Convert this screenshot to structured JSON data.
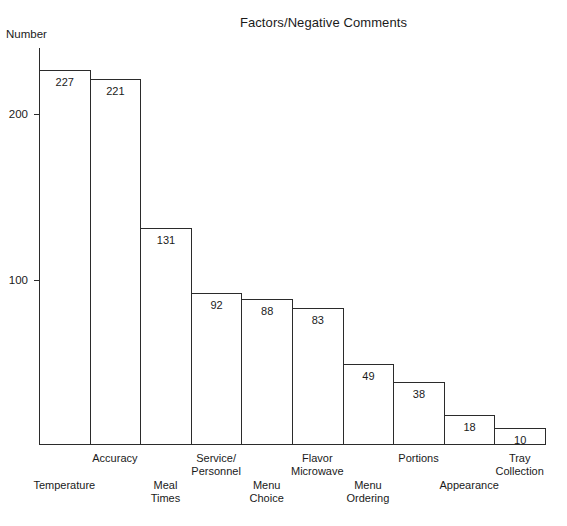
{
  "chart_data": {
    "type": "bar",
    "title": "Factors/Negative Comments",
    "xlabel": "",
    "ylabel": "Number",
    "ylim": [
      0,
      240
    ],
    "grid": false,
    "legend": null,
    "yticks": [
      100,
      200
    ],
    "ytick_labels": [
      "100",
      "200"
    ],
    "categories": [
      "Temperature",
      "Accuracy",
      "Meal\nTimes",
      "Service/\nPersonnel",
      "Menu\nChoice",
      "Flavor\nMicrowave",
      "Menu\nOrdering",
      "Portions",
      "Appearance",
      "Tray\nCollection"
    ],
    "values": [
      227,
      221,
      131,
      92,
      88,
      83,
      49,
      38,
      18,
      10
    ],
    "value_labels": [
      "227",
      "221",
      "131",
      "92",
      "88",
      "83",
      "49",
      "38",
      "18",
      "10"
    ],
    "label_rows": [
      1,
      0,
      1,
      0,
      1,
      0,
      1,
      0,
      1,
      0
    ]
  },
  "colors": {
    "background": "#ffffff",
    "ink": "#2b2b2b",
    "bar_fill": "transparent",
    "bar_stroke": "#2b2b2b"
  }
}
